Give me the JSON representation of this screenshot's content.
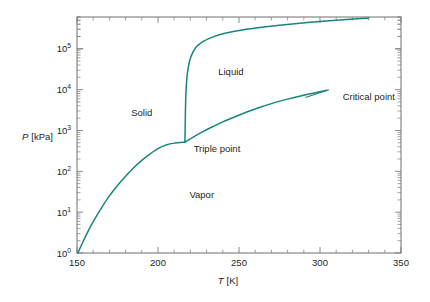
{
  "chart_data": {
    "type": "line",
    "title": "",
    "subtitle": "",
    "xlabel": "T [K]",
    "xlabel_symbol": "T",
    "xlabel_unit": "[K]",
    "ylabel": "P [kPa]",
    "ylabel_symbol": "P",
    "ylabel_unit": "[kPa]",
    "xlim": [
      150,
      350
    ],
    "ylim": [
      1,
      600000
    ],
    "yscale": "log",
    "xscale": "linear",
    "grid": false,
    "legend": "none",
    "accent_color": "#17857a",
    "axis_color": "#7d7d7d",
    "text_color": "#231f20",
    "background": "#ffffff",
    "xticks": [
      150,
      200,
      250,
      300,
      350
    ],
    "xtick_labels": [
      "150",
      "200",
      "250",
      "300",
      "350"
    ],
    "xminor_step": 10,
    "yticks": [
      1,
      10,
      100,
      1000,
      10000,
      100000
    ],
    "ytick_labels": [
      "10",
      "10",
      "10",
      "10",
      "10",
      "10"
    ],
    "ytick_exponents": [
      "0",
      "1",
      "2",
      "3",
      "4",
      "5"
    ],
    "annotations": [
      {
        "name": "solid-region-label",
        "text": "Solid",
        "x": 190,
        "y": 2200
      },
      {
        "name": "liquid-region-label",
        "text": "Liquid",
        "x": 245,
        "y": 23000
      },
      {
        "name": "vapor-region-label",
        "text": "Vapor",
        "x": 227,
        "y": 22
      },
      {
        "name": "triple-point-label",
        "text": "Triple point",
        "x": 222,
        "y": 290
      },
      {
        "name": "critical-point-label",
        "text": "Critical point",
        "x": 314,
        "y": 5500
      }
    ],
    "special_points": {
      "triple_point": {
        "label": "Triple point",
        "T": 216.6,
        "P": 518
      },
      "critical_point": {
        "label": "Critical point",
        "T": 304.2,
        "P": 7380
      }
    },
    "series": [
      {
        "name": "Sublimation curve (Solid–Vapor)",
        "points": [
          [
            150.5,
            1.0
          ],
          [
            154,
            2.0
          ],
          [
            158,
            4.2
          ],
          [
            162,
            8.0
          ],
          [
            166,
            14.5
          ],
          [
            170,
            25
          ],
          [
            175,
            45
          ],
          [
            180,
            76
          ],
          [
            185,
            122
          ],
          [
            190,
            185
          ],
          [
            195,
            265
          ],
          [
            200,
            360
          ],
          [
            205,
            440
          ],
          [
            210,
            490
          ],
          [
            216.6,
            518
          ]
        ]
      },
      {
        "name": "Fusion curve (Solid–Liquid)",
        "points": [
          [
            216.6,
            518
          ],
          [
            216.8,
            1400
          ],
          [
            217.0,
            4000
          ],
          [
            217.4,
            11000
          ],
          [
            218.2,
            26000
          ],
          [
            219.6,
            52000
          ],
          [
            221.5,
            82000
          ],
          [
            224,
            115000
          ],
          [
            228,
            152000
          ],
          [
            234,
            196000
          ],
          [
            242,
            243000
          ],
          [
            252,
            290000
          ],
          [
            264,
            338000
          ],
          [
            278,
            390000
          ],
          [
            294,
            445000
          ],
          [
            312,
            505000
          ],
          [
            330,
            565000
          ]
        ]
      },
      {
        "name": "Vaporization curve (Liquid–Vapor)",
        "points": [
          [
            216.6,
            518
          ],
          [
            222,
            700
          ],
          [
            228,
            950
          ],
          [
            234,
            1250
          ],
          [
            240,
            1620
          ],
          [
            248,
            2200
          ],
          [
            256,
            2950
          ],
          [
            264,
            3800
          ],
          [
            272,
            4800
          ],
          [
            280,
            5850
          ],
          [
            288,
            7000
          ],
          [
            296,
            8200
          ],
          [
            304.2,
            9600
          ]
        ]
      }
    ],
    "leader_lines": [
      {
        "name": "critical-point-leader",
        "from": [
          291,
          6450
        ],
        "to": [
          305.5,
          9900
        ]
      }
    ]
  }
}
